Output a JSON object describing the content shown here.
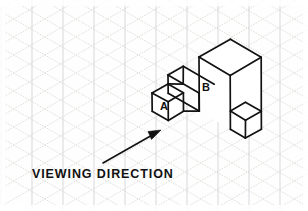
{
  "drawing": {
    "title": "Isometric pictorial view of stepped block",
    "paper": {
      "background_color": "#fefefe",
      "grid_type": "isometric",
      "grid_vertical_color": "#c9c9cf",
      "grid_diagonal_color": "#d6d2cc",
      "grid_spacing_px": 31,
      "grid_angle_deg": 30
    },
    "line_color": "#121212",
    "labels": {
      "face_a": "A",
      "face_b": "B"
    },
    "caption": "VIEWING DIRECTION",
    "arrow": {
      "name": "viewing-direction-arrow",
      "tail": [
        103,
        163
      ],
      "tip": [
        161,
        130
      ],
      "color": "#111111"
    },
    "geometry": {
      "projection": "isometric",
      "unit_right_px": [
        15.5,
        9
      ],
      "unit_left_px": [
        -15.5,
        9
      ],
      "unit_up_px": [
        0,
        -18
      ],
      "description": "Stepped solid built from unit cubes: front-left cube A at base, tall two-high column B behind it, single-height step block at right, raised ledge at rear left."
    }
  }
}
